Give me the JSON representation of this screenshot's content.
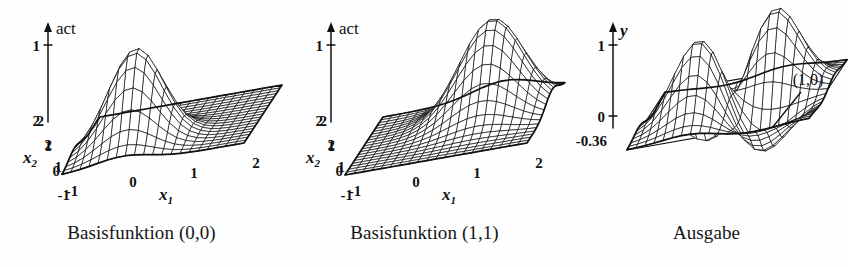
{
  "figure": {
    "background_color": "#fefefe",
    "line_color": "#111111",
    "panel_count": 3
  },
  "panels": [
    {
      "id": "basisfunktion-00",
      "caption": "Basisfunktion (0,0)",
      "vertical_axis": {
        "label": "act",
        "label_style": "upright",
        "ticks": [
          "1"
        ],
        "base_label": "2"
      },
      "depth_axis": {
        "label": "x",
        "label_subscript": "2",
        "ticks": [
          "2",
          "1",
          "0",
          "-1"
        ]
      },
      "horizontal_axis": {
        "label": "x",
        "label_subscript": "1",
        "ticks": [
          "-1",
          "0",
          "1",
          "2"
        ]
      },
      "annotation": null
    },
    {
      "id": "basisfunktion-11",
      "caption": "Basisfunktion (1,1)",
      "vertical_axis": {
        "label": "act",
        "label_style": "upright",
        "ticks": [
          "1"
        ],
        "base_label": "2"
      },
      "depth_axis": {
        "label": "x",
        "label_subscript": "2",
        "ticks": [
          "2",
          "1",
          "0",
          "-1"
        ]
      },
      "horizontal_axis": {
        "label": "x",
        "label_subscript": "1",
        "ticks": [
          "-1",
          "0",
          "1",
          "2"
        ]
      },
      "annotation": null
    },
    {
      "id": "ausgabe",
      "caption": "Ausgabe",
      "vertical_axis": {
        "label": "y",
        "label_style": "italic",
        "ticks": [
          "1",
          "0"
        ],
        "base_label": "-0.36"
      },
      "depth_axis": {
        "label": "",
        "label_subscript": "",
        "ticks": []
      },
      "horizontal_axis": {
        "label": "",
        "label_subscript": "",
        "ticks": []
      },
      "annotation": {
        "text": "(1,0)",
        "has_leader_line": true
      }
    }
  ],
  "chart_data": [
    {
      "type": "surface",
      "title": "Basisfunktion (0,0)",
      "xlabel": "x1",
      "ylabel": "x2",
      "zlabel": "act",
      "xlim": [
        -1,
        2
      ],
      "ylim": [
        -1,
        2
      ],
      "zlim": [
        0,
        1
      ],
      "xticks": [
        -1,
        0,
        1,
        2
      ],
      "yticks": [
        -1,
        0,
        1,
        2
      ],
      "zticks": [
        0,
        1
      ],
      "grid": 20,
      "function": "gaussian",
      "centers": [
        {
          "x": 0,
          "y": 0,
          "amplitude": 1.0,
          "sigma": 0.45
        }
      ],
      "description": "Single radial basis (Gaussian) bump centred at (0,0) on a flat zero plane."
    },
    {
      "type": "surface",
      "title": "Basisfunktion (1,1)",
      "xlabel": "x1",
      "ylabel": "x2",
      "zlabel": "act",
      "xlim": [
        -1,
        2
      ],
      "ylim": [
        -1,
        2
      ],
      "zlim": [
        0,
        1
      ],
      "xticks": [
        -1,
        0,
        1,
        2
      ],
      "yticks": [
        -1,
        0,
        1,
        2
      ],
      "zticks": [
        0,
        1
      ],
      "grid": 20,
      "function": "gaussian",
      "centers": [
        {
          "x": 1,
          "y": 1,
          "amplitude": 1.0,
          "sigma": 0.52
        }
      ],
      "description": "Single radial basis (Gaussian) bump centred at (1,1) on a flat zero plane."
    },
    {
      "type": "surface",
      "title": "Ausgabe",
      "xlabel": "x1",
      "ylabel": "x2",
      "zlabel": "y",
      "xlim": [
        -1,
        2
      ],
      "ylim": [
        -1,
        2
      ],
      "zlim": [
        -0.36,
        1
      ],
      "zticks": [
        -0.36,
        0,
        1
      ],
      "grid": 20,
      "function": "rbf-network-xor",
      "centers": [
        {
          "x": 0,
          "y": 0,
          "amplitude": 1.0,
          "sigma": 0.42
        },
        {
          "x": 1,
          "y": 1,
          "amplitude": 1.0,
          "sigma": 0.42
        },
        {
          "x": 1,
          "y": 0,
          "amplitude": -0.55,
          "sigma": 0.45
        },
        {
          "x": 0,
          "y": 1,
          "amplitude": -0.55,
          "sigma": 0.45
        }
      ],
      "zero_plane": true,
      "annotations": [
        {
          "text": "(1,0)",
          "x": 1,
          "y": 0
        }
      ],
      "description": "Network output: two positive peaks at (0,0) and (1,1), negative troughs at (1,0) and (0,1), minimum -0.36, with the y=0 plane drawn."
    }
  ]
}
